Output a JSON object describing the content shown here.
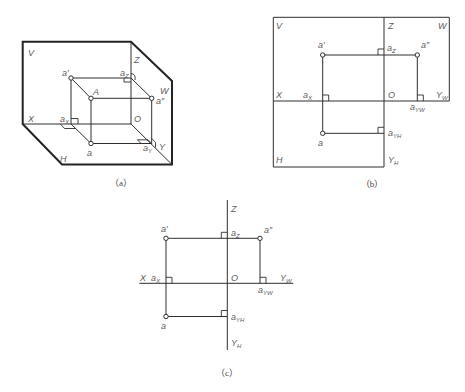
{
  "colors": {
    "line": "#2e2e2e",
    "label": "#5a5a5a",
    "background": "#ffffff"
  },
  "figures": {
    "a": {
      "caption": "（a）",
      "planes": {
        "V": "V",
        "W": "W",
        "H": "H"
      },
      "axes": {
        "X": "X",
        "Y": "Y",
        "Z": "Z",
        "O": "O"
      },
      "points": {
        "A": "A",
        "a": "a",
        "a_prime": "a′",
        "a_double_prime": "a″"
      },
      "projections": {
        "a_x": {
          "base": "a",
          "sub": "X"
        },
        "a_y": {
          "base": "a",
          "sub": "Y"
        },
        "a_z": {
          "base": "a",
          "sub": "Z"
        }
      }
    },
    "b": {
      "caption": "（b）",
      "planes": {
        "V": "V",
        "W": "W",
        "H": "H"
      },
      "axes": {
        "X": "X",
        "Z": "Z",
        "O": "O",
        "Y_W": {
          "base": "Y",
          "sub": "W"
        },
        "Y_H": {
          "base": "Y",
          "sub": "H"
        }
      },
      "points": {
        "a": "a",
        "a_prime": "a′",
        "a_double_prime": "a″"
      },
      "projections": {
        "a_x": {
          "base": "a",
          "sub": "X"
        },
        "a_z": {
          "base": "a",
          "sub": "Z"
        },
        "a_yw": {
          "base": "a",
          "sub": "YW"
        },
        "a_yh": {
          "base": "a",
          "sub": "YH"
        }
      }
    },
    "c": {
      "caption": "（c）",
      "axes": {
        "X": "X",
        "Z": "Z",
        "O": "O",
        "Y_W": {
          "base": "Y",
          "sub": "W"
        },
        "Y_H": {
          "base": "Y",
          "sub": "H"
        }
      },
      "points": {
        "a": "a",
        "a_prime": "a′",
        "a_double_prime": "a″"
      },
      "projections": {
        "a_x": {
          "base": "a",
          "sub": "X"
        },
        "a_z": {
          "base": "a",
          "sub": "Z"
        },
        "a_yw": {
          "base": "a",
          "sub": "YW"
        },
        "a_yh": {
          "base": "a",
          "sub": "YH"
        }
      }
    }
  }
}
